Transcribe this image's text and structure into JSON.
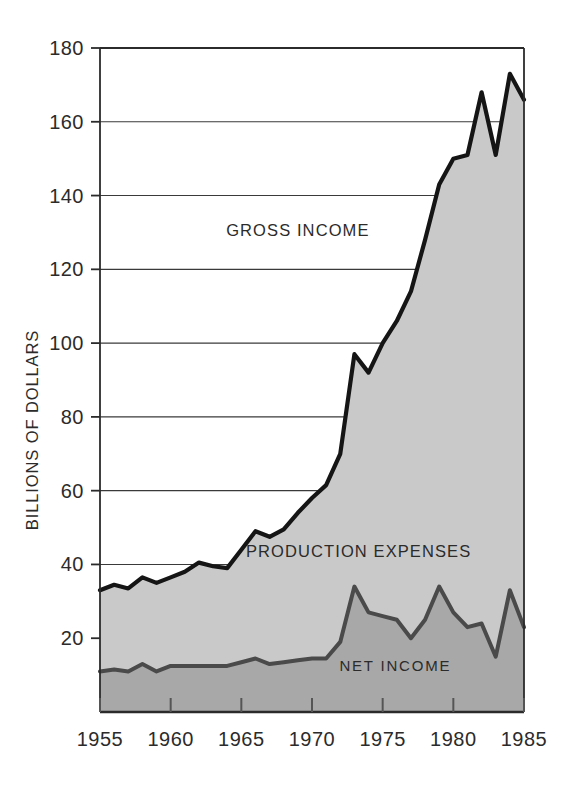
{
  "chart_data": {
    "type": "area",
    "title": "",
    "subtitle": "",
    "xlabel": "",
    "ylabel": "BILLIONS OF DOLLARS",
    "xlim": [
      1955,
      1985
    ],
    "ylim": [
      0,
      180
    ],
    "yticks": [
      20,
      40,
      60,
      80,
      100,
      120,
      140,
      160,
      180
    ],
    "ytick_labels": [
      "20",
      "40",
      "60",
      "80",
      "100",
      "120",
      "140",
      "160",
      "180"
    ],
    "xticks": [
      1955,
      1960,
      1965,
      1970,
      1975,
      1980,
      1985
    ],
    "xtick_labels": [
      "1955",
      "1960",
      "1965",
      "1970",
      "1975",
      "1980",
      "1985"
    ],
    "grid": "horizontal",
    "legend_position": "inline-annotations",
    "annotations": [
      {
        "text": "GROSS INCOME",
        "x": 1969.0,
        "y": 129
      },
      {
        "text": "PRODUCTION EXPENSES",
        "x": 1973.3,
        "y": 42
      },
      {
        "text": "NET INCOME",
        "x": 1975.9,
        "y": 11
      }
    ],
    "x": [
      1955,
      1956,
      1957,
      1958,
      1959,
      1960,
      1961,
      1962,
      1963,
      1964,
      1965,
      1966,
      1967,
      1968,
      1969,
      1970,
      1971,
      1972,
      1973,
      1974,
      1975,
      1976,
      1977,
      1978,
      1979,
      1980,
      1981,
      1982,
      1983,
      1984
    ],
    "series": [
      {
        "name": "GROSS INCOME",
        "fill_color": "#c9c9c9",
        "line_color": "#151515",
        "values": [
          33,
          34.5,
          33.5,
          36.5,
          35,
          36.5,
          38,
          40.5,
          39.5,
          39,
          44,
          49,
          47.5,
          49.5,
          54,
          58,
          61.5,
          70,
          97,
          92,
          100,
          106,
          114,
          128,
          143,
          150,
          151,
          168,
          151,
          173
        ]
      },
      {
        "name": "NET INCOME",
        "fill_color": "#a8a8a8",
        "line_color": "#4a4a4a",
        "values": [
          11,
          11.5,
          11,
          13,
          11,
          12.5,
          12.5,
          12.5,
          12.5,
          12.5,
          13.5,
          14.5,
          13,
          13.5,
          14,
          14.5,
          14.5,
          19,
          34,
          27,
          26,
          25,
          20,
          25,
          34,
          27,
          23,
          24,
          15,
          33
        ]
      }
    ],
    "derived_band": {
      "name": "PRODUCTION EXPENSES",
      "description": "Region between NET INCOME and GROSS INCOME"
    },
    "end_points": {
      "gross_income_final": 166,
      "net_income_final": 23
    }
  },
  "axis": {
    "y_title": "BILLIONS OF DOLLARS"
  },
  "labels": {
    "gross_income": "GROSS INCOME",
    "production_expenses": "PRODUCTION EXPENSES",
    "net_income": "NET INCOME"
  },
  "colors": {
    "expenses_fill": "#c9c9c9",
    "net_fill": "#a8a8a8",
    "gross_line": "#151515",
    "net_line": "#4a4a4a",
    "grid": "#3a3a3a",
    "axis": "#2b2b2b",
    "background": "#ffffff"
  }
}
